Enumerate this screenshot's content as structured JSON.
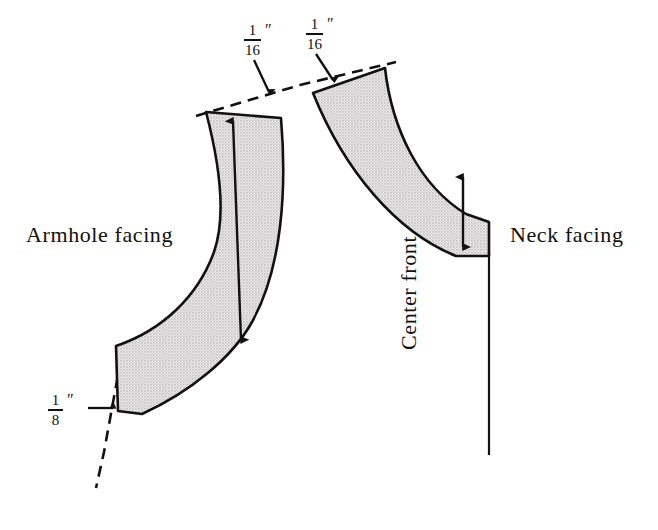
{
  "figure": {
    "background_color": "#ffffff",
    "ink_color": "#111111",
    "fill_color": "#dcdcdc"
  },
  "labels": {
    "armhole_facing": "Armhole facing",
    "neck_facing": "Neck facing",
    "center_front": "Center front"
  },
  "measurements": [
    {
      "id": "shoulder-left",
      "numerator": "1",
      "denominator": "16",
      "unit": "″",
      "points_to": "armhole-facing-shoulder-edge"
    },
    {
      "id": "shoulder-right",
      "numerator": "1",
      "denominator": "16",
      "unit": "″",
      "points_to": "neck-facing-shoulder-edge"
    },
    {
      "id": "underarm",
      "numerator": "1",
      "denominator": "8",
      "unit": "″",
      "points_to": "armhole-facing-underarm-edge"
    }
  ],
  "pieces": [
    {
      "name": "armhole-facing",
      "grainline": "double-arrow",
      "fill": "stipple"
    },
    {
      "name": "neck-facing",
      "grainline": "double-arrow",
      "fill": "stipple"
    }
  ]
}
